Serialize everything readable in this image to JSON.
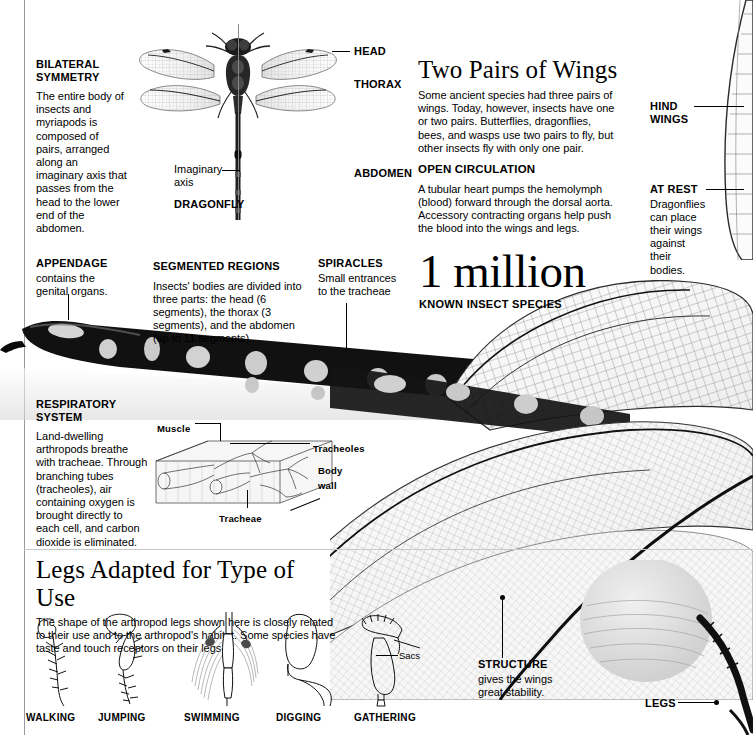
{
  "figure": {
    "organism": "Dragonfly"
  },
  "left_column": {
    "bilateral": {
      "heading_line1": "BILATERAL",
      "heading_line2": "SYMMETRY",
      "body": "The entire body of insects and myriapods is composed of pairs, arranged along an imaginary axis that passes from the head to the lower end of the abdomen."
    },
    "appendage": {
      "heading": "APPENDAGE",
      "body": "contains the genital organs."
    },
    "respiratory": {
      "heading_line1": "RESPIRATORY",
      "heading_line2": "SYSTEM",
      "body": "Land-dwelling arthropods breathe with tracheae. Through branching tubes (tracheoles), air containing oxygen is brought directly to each cell, and carbon dioxide is eliminated."
    }
  },
  "dragonfly_diagram": {
    "caption": "DRAGONFLY",
    "axis_label_line1": "Imaginary",
    "axis_label_line2": "axis",
    "callouts": [
      {
        "label": "HEAD"
      },
      {
        "label": "THORAX"
      },
      {
        "label": "ABDOMEN"
      }
    ]
  },
  "middle_column": {
    "segmented": {
      "heading": "SEGMENTED REGIONS",
      "body": "Insects' bodies are divided into three parts: the head (6 segments), the thorax (3 segments), and the abdomen (up to 11 segments)."
    },
    "spiracles": {
      "heading": "SPIRACLES",
      "body": "Small entrances to the tracheae"
    }
  },
  "right_column": {
    "two_pairs": {
      "title": "Two Pairs of Wings",
      "body": "Some ancient species had three pairs of wings. Today, however, insects have one or two pairs. Butterflies, dragonflies, bees, and wasps use two pairs to fly, but other insects fly with only one pair."
    },
    "open_circulation": {
      "heading": "OPEN CIRCULATION",
      "body": "A tubular heart pumps the hemolymph (blood) forward through the dorsal aorta. Accessory contracting organs help push the blood into the wings and legs."
    }
  },
  "far_right": {
    "hind_wings": {
      "heading_line1": "HIND",
      "heading_line2": "WINGS"
    },
    "at_rest": {
      "heading": "AT REST",
      "body": "Dragonflies can place their wings against their bodies."
    },
    "legs": {
      "heading": "LEGS"
    }
  },
  "stat": {
    "value": "1 million",
    "caption": "KNOWN INSECT SPECIES"
  },
  "tracheae_diagram": {
    "labels": {
      "muscle": "Muscle",
      "tracheoles": "Tracheoles",
      "body_wall_line1": "Body",
      "body_wall_line2": "wall",
      "tracheae": "Tracheae"
    }
  },
  "structure_callout": {
    "heading": "STRUCTURE",
    "body": "gives the wings great stability."
  },
  "legs_section": {
    "title": "Legs Adapted for Type of Use",
    "body": "The shape of the arthropod legs shown here is closely related to their use and to the arthropod's habitat. Some species have taste and touch receptors on their legs.",
    "sacs_label": "Sacs",
    "items": [
      {
        "caption": "WALKING"
      },
      {
        "caption": "JUMPING"
      },
      {
        "caption": "SWIMMING"
      },
      {
        "caption": "DIGGING"
      },
      {
        "caption": "GATHERING"
      }
    ]
  },
  "colors": {
    "ink": "#000000",
    "rule": "#9a9a9a",
    "paper": "#ffffff"
  }
}
